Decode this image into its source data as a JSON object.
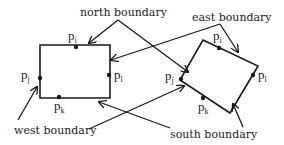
{
  "diagram": {
    "labels": {
      "north": "north boundary",
      "east": "east boundary",
      "west": "west boundary",
      "south": "south boundary"
    },
    "points": {
      "i": {
        "base": "p",
        "sub": "i"
      },
      "j": {
        "base": "p",
        "sub": "j"
      },
      "k": {
        "base": "p",
        "sub": "k"
      },
      "l": {
        "base": "p",
        "sub": "l"
      }
    },
    "shapes": [
      {
        "name": "axis-aligned-rectangle",
        "corners": [
          [
            40,
            45
          ],
          [
            110,
            45
          ],
          [
            110,
            98
          ],
          [
            40,
            98
          ]
        ]
      },
      {
        "name": "rotated-rectangle",
        "corners": [
          [
            203,
            40
          ],
          [
            258,
            66
          ],
          [
            230,
            113
          ],
          [
            180,
            80
          ]
        ]
      }
    ],
    "colors": {
      "ink": "#1a1a1a",
      "background": "#ffffff"
    }
  }
}
